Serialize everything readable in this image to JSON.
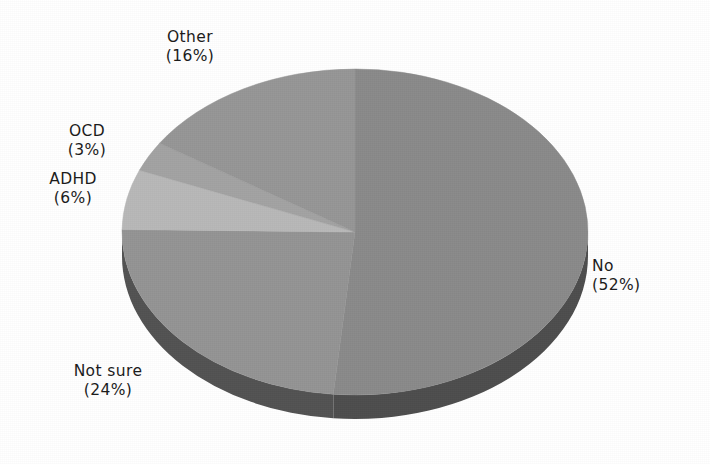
{
  "chart_data": {
    "type": "pie",
    "title": "",
    "subtitle": "",
    "xlabel": "",
    "ylabel": "",
    "grid": false,
    "legend_position": "none",
    "label_format": "name-above-percent-in-parentheses",
    "style": "3d-exploded-none-grayscale",
    "start_angle_deg": 0,
    "direction": "clockwise",
    "categories": [
      "No",
      "Not sure",
      "ADHD",
      "OCD",
      "Other"
    ],
    "values": [
      52,
      24,
      6,
      3,
      16
    ],
    "units": "percent",
    "total_labeled_percent": 101,
    "colors": [
      "#8a8a8a",
      "#949494",
      "#b8b8b8",
      "#a3a3a3",
      "#969696"
    ],
    "slices": [
      {
        "name": "No",
        "percent": 52,
        "label": "No",
        "percent_label": "(52%)",
        "color": "#8a8a8a",
        "side_color": "#4d4d4d"
      },
      {
        "name": "Not sure",
        "percent": 24,
        "label": "Not sure",
        "percent_label": "(24%)",
        "color": "#949494",
        "side_color": "#525252"
      },
      {
        "name": "ADHD",
        "percent": 6,
        "label": "ADHD",
        "percent_label": "(6%)",
        "color": "#b8b8b8",
        "side_color": "#6b6b6b"
      },
      {
        "name": "OCD",
        "percent": 3,
        "label": "OCD",
        "percent_label": "(3%)",
        "color": "#a3a3a3",
        "side_color": "#5c5c5c"
      },
      {
        "name": "Other",
        "percent": 16,
        "label": "Other",
        "percent_label": "(16%)",
        "color": "#969696",
        "side_color": "#545454"
      }
    ]
  },
  "labels": {
    "other": {
      "name": "Other",
      "percent": "(16%)"
    },
    "ocd": {
      "name": "OCD",
      "percent": "(3%)"
    },
    "adhd": {
      "name": "ADHD",
      "percent": "(6%)"
    },
    "not_sure": {
      "name": "Not sure",
      "percent": "(24%)"
    },
    "no": {
      "name": "No",
      "percent": "(52%)"
    }
  },
  "figure": {
    "background": "#ffffff",
    "text_color": "#1c1c1c",
    "rim_color": "#4a4a4a"
  }
}
